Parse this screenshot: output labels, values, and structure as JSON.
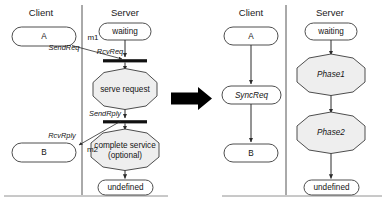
{
  "diagram": {
    "transform_arrow": "big-right-arrow",
    "left_figure": {
      "lanes": [
        {
          "id": "client",
          "label": "Client"
        },
        {
          "id": "server",
          "label": "Server"
        }
      ],
      "client_nodes": [
        {
          "id": "a",
          "label": "A",
          "kind": "state"
        },
        {
          "id": "b",
          "label": "B",
          "kind": "state"
        }
      ],
      "server_nodes": [
        {
          "id": "waiting",
          "label": "waiting",
          "kind": "state"
        },
        {
          "id": "serve_request",
          "label": "serve request",
          "kind": "action"
        },
        {
          "id": "complete_service_1",
          "label": "complete service",
          "kind": "action"
        },
        {
          "id": "complete_service_2",
          "label": "(optional)",
          "kind": "action"
        },
        {
          "id": "undefined",
          "label": "undefined",
          "kind": "state"
        }
      ],
      "edge_labels": [
        {
          "id": "send_req",
          "label": "SendReq"
        },
        {
          "id": "rcv_req",
          "label": "RcvReq"
        },
        {
          "id": "send_rply",
          "label": "SendRply"
        },
        {
          "id": "rcv_rply",
          "label": "RcvRply"
        }
      ],
      "messages": [
        {
          "id": "m1",
          "label": "m1"
        },
        {
          "id": "m2",
          "label": "m2"
        }
      ]
    },
    "right_figure": {
      "lanes": [
        {
          "id": "client",
          "label": "Client"
        },
        {
          "id": "server",
          "label": "Server"
        }
      ],
      "client_nodes": [
        {
          "id": "a",
          "label": "A",
          "kind": "state"
        },
        {
          "id": "syncreq",
          "label": "SyncReq",
          "kind": "state-italic"
        },
        {
          "id": "b",
          "label": "B",
          "kind": "state"
        }
      ],
      "server_nodes": [
        {
          "id": "waiting",
          "label": "waiting",
          "kind": "state"
        },
        {
          "id": "phase1",
          "label": "Phase1",
          "kind": "action-italic"
        },
        {
          "id": "phase2",
          "label": "Phase2",
          "kind": "action-italic"
        },
        {
          "id": "undefined",
          "label": "undefined",
          "kind": "state"
        }
      ]
    },
    "colors": {
      "action_fill": "#eeeeee",
      "state_fill": "#ffffff",
      "stroke": "#3a3a3a",
      "bar": "#111111",
      "arrow": "#000000",
      "divider": "#555555"
    }
  }
}
